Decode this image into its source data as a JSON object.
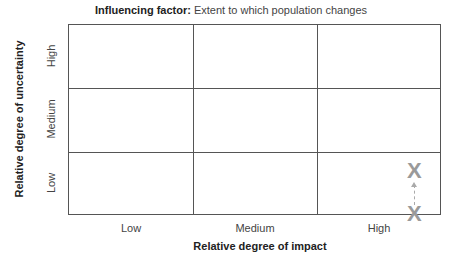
{
  "title": {
    "label": "Influencing factor:",
    "text": "Extent to which population changes"
  },
  "x_axis": {
    "title": "Relative degree of impact",
    "ticks": [
      "Low",
      "Medium",
      "High"
    ]
  },
  "y_axis": {
    "title": "Relative degree of uncertainty",
    "ticks": [
      "Low",
      "Medium",
      "High"
    ]
  },
  "markers": [
    {
      "symbol": "X",
      "impact": "High",
      "uncertainty": "Low",
      "position": "upper"
    },
    {
      "symbol": "X",
      "impact": "High",
      "uncertainty": "Low",
      "position": "lower"
    }
  ],
  "colors": {
    "grid": "#555555",
    "marker": "#9a9a9a"
  }
}
